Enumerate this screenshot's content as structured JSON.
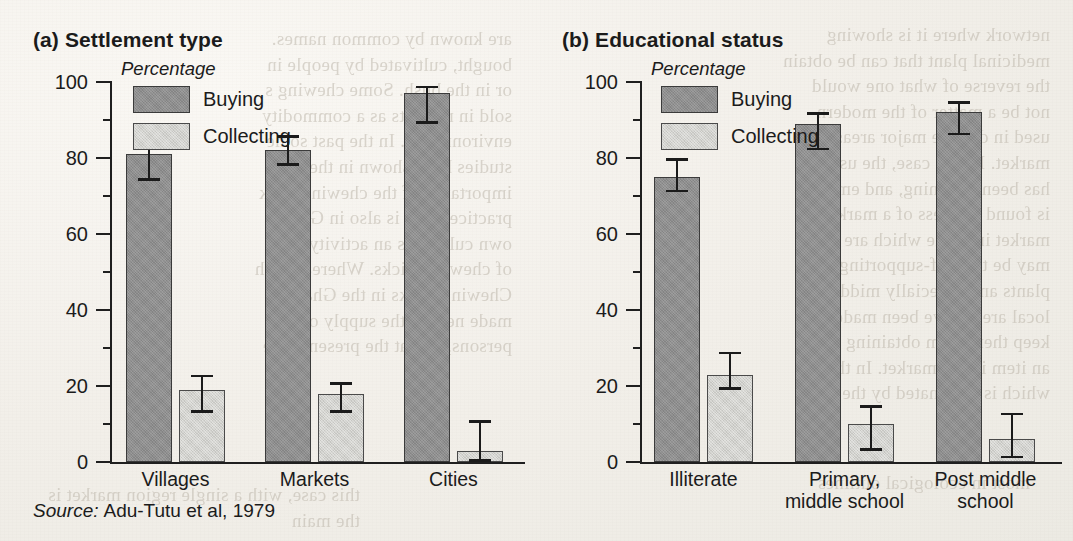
{
  "figure": {
    "source_key": "Source:",
    "source_value": "Adu-Tutu et al, 1979",
    "background_color": "#f2efe9",
    "ink_color": "#1b1b1b",
    "series_colors": {
      "buying": "#8e8e8e",
      "collecting": "#d2d2ce"
    }
  },
  "ghost_text": {
    "left": "are known by common names.\nbought, cultivated by people in\nor in the bush. Some chewing s\nsold in markets as a commodity\nenvironments. In the past some\nstudies have shown in the co\nimportance of the chewing stick\npractice. This is also in Ghana\nown culture as an activity that\nof chewing sticks. Whereas in th\nChewing sticks in the Ghanaia\nmade near to the supply of ch\npersons, and at the present time",
    "right": "network where it is showing\nmedicinal plant that can be obtain\nthe reverse of what one would\nnot be a matter of the modern\nused in diverse major areas to c\nmarket. In this case, the use of\nhas been declining, and employ\nis found and less of a marketed\nmarket into one which are ob\nmay be the self-supporting one\nplants and especially middle as\nlocal areas have been made as\nkeep them from obtaining the\nan item in the market. In this a\nwhich is dominated by the chew",
    "bottom_left": "this case, with a single region market is\nthe main",
    "bottom_right": "most in ecological outlines"
  },
  "chart_data": [
    {
      "type": "bar",
      "panel": "(a)",
      "title": "(a) Settlement type",
      "ylabel": "Percentage",
      "xlabel": "",
      "ylim": [
        0,
        100
      ],
      "yticks": [
        0,
        20,
        40,
        60,
        80,
        100
      ],
      "ytick_labels": [
        "0",
        "20",
        "40",
        "60",
        "80",
        "100"
      ],
      "categories": [
        "Villages",
        "Markets",
        "Cities"
      ],
      "legend": [
        "Buying",
        "Collecting"
      ],
      "legend_position": "upper-center",
      "grid": false,
      "series": [
        {
          "name": "Buying",
          "values": [
            81,
            82,
            97
          ],
          "err_low": [
            74,
            78,
            89
          ],
          "err_high": [
            88,
            86,
            99
          ]
        },
        {
          "name": "Collecting",
          "values": [
            19,
            18,
            3
          ],
          "err_low": [
            13,
            13,
            0
          ],
          "err_high": [
            23,
            21,
            11
          ]
        }
      ]
    },
    {
      "type": "bar",
      "panel": "(b)",
      "title": "(b) Educational status",
      "ylabel": "Percentage",
      "xlabel": "",
      "ylim": [
        0,
        100
      ],
      "yticks": [
        0,
        20,
        40,
        60,
        80,
        100
      ],
      "ytick_labels": [
        "0",
        "20",
        "40",
        "60",
        "80",
        "100"
      ],
      "categories": [
        "Illiterate",
        "Primary,\nmiddle school",
        "Post middle\nschool"
      ],
      "legend": [
        "Buying",
        "Collecting"
      ],
      "legend_position": "upper-center",
      "grid": false,
      "series": [
        {
          "name": "Buying",
          "values": [
            75,
            89,
            92
          ],
          "err_low": [
            71,
            82,
            86
          ],
          "err_high": [
            80,
            92,
            95
          ]
        },
        {
          "name": "Collecting",
          "values": [
            23,
            10,
            6
          ],
          "err_low": [
            19,
            3,
            1
          ],
          "err_high": [
            29,
            15,
            13
          ]
        }
      ]
    }
  ]
}
